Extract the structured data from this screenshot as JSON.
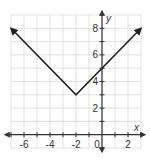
{
  "chart_data": {
    "type": "line",
    "title": "",
    "xlabel": "x",
    "ylabel": "y",
    "xlim": [
      -7,
      3
    ],
    "ylim": [
      -1,
      9
    ],
    "grid": true,
    "x_tick_labels": [
      "-6",
      "-4",
      "-2",
      "0",
      "2"
    ],
    "x_tick_values": [
      -6,
      -4,
      -2,
      0,
      2
    ],
    "y_tick_labels": [
      "2",
      "4",
      "6",
      "8"
    ],
    "y_tick_values": [
      2,
      4,
      6,
      8
    ],
    "series": [
      {
        "name": "absolute value graph",
        "points": [
          [
            -7,
            8
          ],
          [
            -2,
            3
          ],
          [
            3,
            8
          ]
        ],
        "arrows_at_ends": true,
        "vertex": [
          -2,
          3
        ],
        "y_intercept": 5
      }
    ]
  }
}
